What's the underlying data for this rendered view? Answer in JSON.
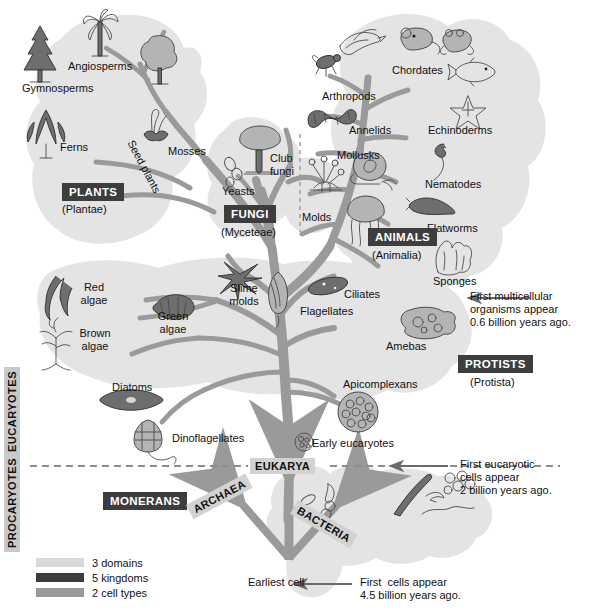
{
  "diagram": {
    "colors": {
      "blob": "#e4e4e4",
      "branch": "#9a9a9a",
      "kingdom_box": "#3d3d3d",
      "domain_box": "#d2d2d2",
      "sidebar_box": "#c9c9c9",
      "text": "#111111",
      "legend_domains": "#d9d9d9",
      "legend_kingdoms": "#3d3d3d",
      "legend_celltypes": "#9a9a9a"
    }
  },
  "kingdoms": [
    {
      "name": "PLANTS",
      "latin": "(Plantae)"
    },
    {
      "name": "FUNGI",
      "latin": "(Myceteae)"
    },
    {
      "name": "ANIMALS",
      "latin": "(Animalia)"
    },
    {
      "name": "PROTISTS",
      "latin": "(Protista)"
    },
    {
      "name": "MONERANS",
      "latin": ""
    }
  ],
  "domains": [
    {
      "name": "EUKARYA"
    },
    {
      "name": "ARCHAEA"
    },
    {
      "name": "BACTERIA"
    }
  ],
  "cell_types": [
    {
      "name": "EUCARYOTES"
    },
    {
      "name": "PROCARYOTES"
    }
  ],
  "taxa": {
    "plants": [
      {
        "label": "Angiosperms"
      },
      {
        "label": "Gymnosperms"
      },
      {
        "label": "Ferns"
      },
      {
        "label": "Mosses"
      },
      {
        "label": "Seed plants"
      }
    ],
    "fungi": [
      {
        "label": "Club\nfungi"
      },
      {
        "label": "Yeasts"
      },
      {
        "label": "Molds"
      }
    ],
    "animals": [
      {
        "label": "Chordates"
      },
      {
        "label": "Arthropods"
      },
      {
        "label": "Annelids"
      },
      {
        "label": "Echinoderms"
      },
      {
        "label": "Mollusks"
      },
      {
        "label": "Nematodes"
      },
      {
        "label": "Flatworms"
      },
      {
        "label": "Sponges"
      }
    ],
    "protists": [
      {
        "label": "Red\nalgae"
      },
      {
        "label": "Brown\nalgae"
      },
      {
        "label": "Green\nalgae"
      },
      {
        "label": "Slime\nmolds"
      },
      {
        "label": "Diatoms"
      },
      {
        "label": "Dinoflagellates"
      },
      {
        "label": "Flagellates"
      },
      {
        "label": "Ciliates"
      },
      {
        "label": "Amebas"
      },
      {
        "label": "Apicomplexans"
      }
    ],
    "root": [
      {
        "label": "Early eucaryotes"
      },
      {
        "label": "Earliest cell"
      }
    ]
  },
  "annotations": [
    {
      "text": "First multicellular\norganisms appear\n0.6 billion years ago."
    },
    {
      "text": "First eucaryotic\ncells appear\n2 billion years ago."
    },
    {
      "text": "First  cells appear\n4.5 billion years ago."
    }
  ],
  "legend": [
    {
      "label": "3 domains",
      "color": "#d9d9d9"
    },
    {
      "label": "5 kingdoms",
      "color": "#3d3d3d"
    },
    {
      "label": "2 cell types",
      "color": "#9a9a9a"
    }
  ]
}
